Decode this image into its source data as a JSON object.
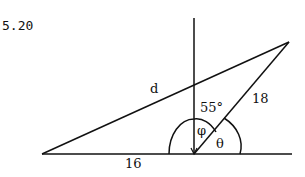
{
  "problem_number": "5.20",
  "labels": {
    "d": "d",
    "side_18": "18",
    "side_16": "16",
    "angle_55": "55°",
    "phi": "φ",
    "theta": "θ"
  },
  "colors": {
    "ink": "#111111",
    "background": "#ffffff"
  }
}
